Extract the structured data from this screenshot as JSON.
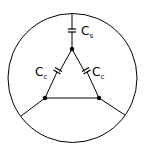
{
  "diagram": {
    "type": "circuit-schematic",
    "labels": {
      "shield_cap": {
        "main": "C",
        "sub": "s"
      },
      "coupling_cap_left": {
        "main": "C",
        "sub": "c"
      },
      "coupling_cap_right": {
        "main": "C",
        "sub": "c"
      }
    },
    "colors": {
      "stroke": "#000000",
      "background": "#ffffff"
    },
    "nodes": [
      {
        "id": "top",
        "x": 72,
        "y": 49
      },
      {
        "id": "bottom-left",
        "x": 45,
        "y": 98
      },
      {
        "id": "bottom-right",
        "x": 99,
        "y": 98
      }
    ]
  }
}
